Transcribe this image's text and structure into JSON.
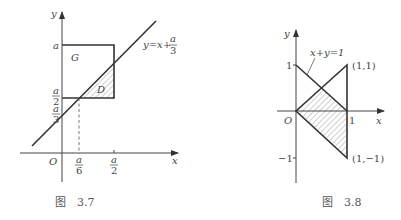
{
  "figures": [
    {
      "id": "fig-3-7",
      "caption": "图　3.7",
      "axes": {
        "x_label": "x",
        "y_label": "y",
        "origin_label": "O"
      },
      "y_ticks": [
        {
          "num": "a",
          "den": ""
        },
        {
          "num": "a",
          "den": "2"
        },
        {
          "num": "a",
          "den": "3"
        }
      ],
      "x_ticks": [
        {
          "num": "a",
          "den": "6"
        },
        {
          "num": "a",
          "den": "2"
        }
      ],
      "line_label": {
        "lhs": "y=x+",
        "num": "a",
        "den": "3"
      },
      "region_labels": {
        "square": "G",
        "shaded": "D"
      }
    },
    {
      "id": "fig-3-8",
      "caption": "图　3.8",
      "axes": {
        "x_label": "x",
        "y_label": "y",
        "origin_label": "O"
      },
      "y_ticks": [
        "1",
        "−1"
      ],
      "x_ticks": [
        "1"
      ],
      "line_label": "x+y=1",
      "points": [
        "(1,1)",
        "(1,−1)"
      ]
    }
  ],
  "colors": {
    "stroke": "#333333",
    "hatch": "#777777",
    "text": "#444444"
  }
}
